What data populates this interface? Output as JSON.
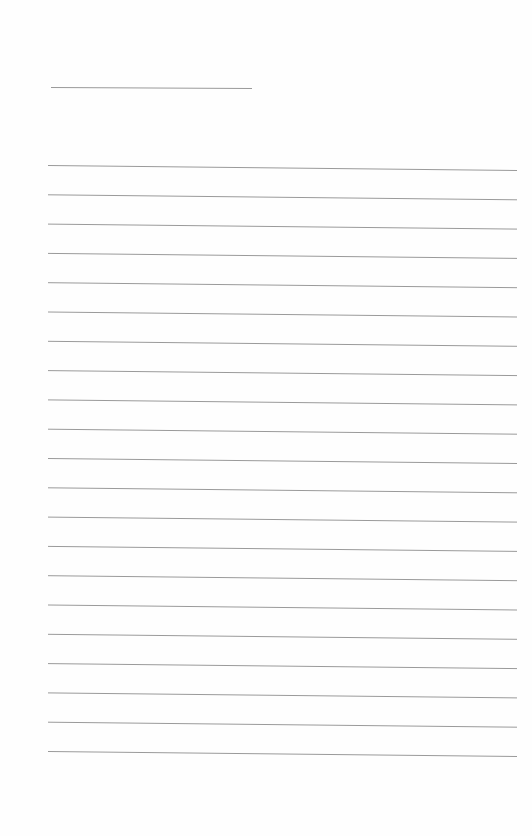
{
  "page": {
    "background": "#fefefe",
    "line_color": "#9a9a9a",
    "header_line": {
      "x1": 51,
      "y1": 87,
      "x2": 252,
      "y2": 88
    },
    "ruled_lines": {
      "count": 21,
      "x_start": 48,
      "x_end": 517,
      "first_y": 165,
      "spacing": 29.3,
      "right_drift": 5
    }
  }
}
